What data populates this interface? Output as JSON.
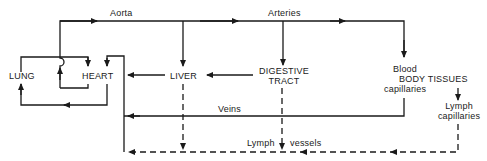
{
  "diagram": {
    "line_color": "#1a1a1a",
    "nodes": {
      "lung": "LUNG",
      "heart": "HEART",
      "liver": "LIVER",
      "digestive_1": "DIGESTIVE",
      "digestive_2": "TRACT",
      "blood": "Blood",
      "body_tissues": "BODY TISSUES",
      "capillaries": "capillaries",
      "lymph_cap_1": "Lymph",
      "lymph_cap_2": "capillaries"
    },
    "edge_labels": {
      "aorta": "Aorta",
      "arteries": "Arteries",
      "veins": "Veins",
      "lymph": "Lymph",
      "vessels": "vessels"
    }
  }
}
